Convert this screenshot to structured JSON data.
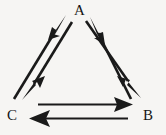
{
  "diagram": {
    "type": "directed-graph",
    "background_color": "#f6f5f3",
    "stroke_color": "#1a1a1a",
    "nodes": [
      {
        "id": "A",
        "label": "A",
        "x": 79,
        "y": 11,
        "position": "top-center"
      },
      {
        "id": "B",
        "label": "B",
        "x": 148,
        "y": 116,
        "position": "bottom-right"
      },
      {
        "id": "C",
        "label": "C",
        "x": 12,
        "y": 116,
        "position": "bottom-left"
      }
    ],
    "edges": [
      {
        "id": "edge-c-to-a",
        "from": "C",
        "to": "A",
        "direction": "up-right",
        "side": "left"
      },
      {
        "id": "edge-a-to-c",
        "from": "A",
        "to": "C",
        "direction": "down-left",
        "side": "left"
      },
      {
        "id": "edge-b-to-a",
        "from": "B",
        "to": "A",
        "direction": "up-left",
        "side": "right"
      },
      {
        "id": "edge-a-to-b",
        "from": "A",
        "to": "B",
        "direction": "down-right",
        "side": "right"
      },
      {
        "id": "edge-c-to-b",
        "from": "C",
        "to": "B",
        "direction": "right",
        "side": "bottom"
      },
      {
        "id": "edge-b-to-c",
        "from": "B",
        "to": "C",
        "direction": "left",
        "side": "bottom"
      }
    ]
  }
}
